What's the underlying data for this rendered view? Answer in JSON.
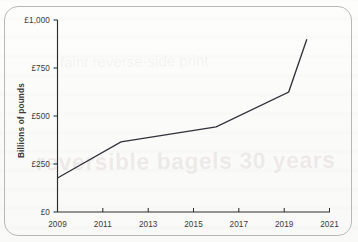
{
  "figure": {
    "frame": "rounded-rectangle-border",
    "background_showthrough_text": "reversible bagels 30 years",
    "background_showthrough_text_2": "faint reverse-side print"
  },
  "chart_data": {
    "type": "line",
    "title": "",
    "xlabel": "",
    "ylabel": "Billions of pounds",
    "xlim": [
      2009,
      2021
    ],
    "ylim": [
      0,
      1000
    ],
    "grid": false,
    "legend": null,
    "x_tick_labels": [
      "2009",
      "2011",
      "2013",
      "2015",
      "2017",
      "2019",
      "2021"
    ],
    "x_ticks": [
      2009,
      2011,
      2013,
      2015,
      2017,
      2019,
      2021
    ],
    "y_tick_labels": [
      "£0",
      "£250",
      "£500",
      "£750",
      "£1,000"
    ],
    "y_ticks": [
      0,
      250,
      500,
      750,
      1000
    ],
    "series": [
      {
        "name": "Billions of pounds",
        "color": "#32323a",
        "x": [
          2009,
          2011.8,
          2016.0,
          2019.2,
          2020.0
        ],
        "values": [
          177,
          365,
          443,
          625,
          900
        ]
      }
    ],
    "currency_prefix": "£",
    "units": "Billions of pounds"
  },
  "axis": {
    "y_label": "Billions of pounds",
    "ticks_y": [
      {
        "label": "£1,000",
        "value": 1000
      },
      {
        "label": "£750",
        "value": 750
      },
      {
        "label": "£500",
        "value": 500
      },
      {
        "label": "£250",
        "value": 250
      },
      {
        "label": "£0",
        "value": 0
      }
    ],
    "ticks_x": [
      {
        "label": "2009",
        "value": 2009
      },
      {
        "label": "2011",
        "value": 2011
      },
      {
        "label": "2013",
        "value": 2013
      },
      {
        "label": "2015",
        "value": 2015
      },
      {
        "label": "2017",
        "value": 2017
      },
      {
        "label": "2019",
        "value": 2019
      },
      {
        "label": "2021",
        "value": 2021
      }
    ]
  }
}
